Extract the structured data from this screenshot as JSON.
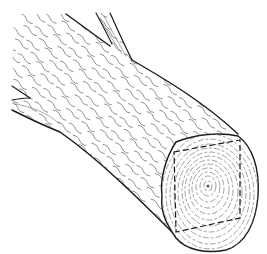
{
  "image": {
    "subject": "Line-art illustration of a round log with a square timber outline dashed on its cut end",
    "colors": {
      "background": "#ffffff",
      "ink": "#1a1a1a",
      "grain": "#6e6e6e",
      "ring": "#7a7a7a"
    },
    "elements": {
      "log_body": "log-body",
      "branch_top": "branch-stub-top",
      "branch_left": "branch-stub-left",
      "end_grain": "cut-end-face",
      "square_outline": "dashed-square-timber-outline"
    }
  }
}
